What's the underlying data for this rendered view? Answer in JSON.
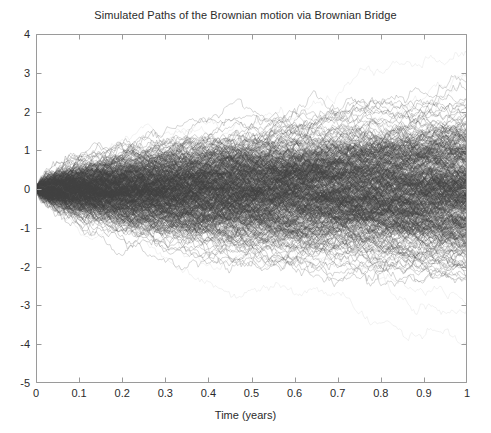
{
  "chart": {
    "title": "Simulated Paths of the Brownian motion via Brownian Bridge",
    "xlabel": "Time (years)",
    "ylabel": ""
  },
  "chart_data": {
    "type": "line",
    "title": "Simulated Paths of the Brownian motion via Brownian Bridge",
    "subtitle": "",
    "xlabel": "Time (years)",
    "ylabel": "",
    "xlim": [
      0,
      1
    ],
    "ylim": [
      -5,
      4
    ],
    "xticks": [
      0,
      0.1,
      0.2,
      0.3,
      0.4,
      0.5,
      0.6,
      0.7,
      0.8,
      0.9,
      1
    ],
    "xticklabels": [
      "0",
      "0.1",
      "0.2",
      "0.3",
      "0.4",
      "0.5",
      "0.6",
      "0.7",
      "0.8",
      "0.9",
      "1"
    ],
    "yticks": [
      -5,
      -4,
      -3,
      -2,
      -1,
      0,
      1,
      2,
      3,
      4
    ],
    "yticklabels": [
      "-5",
      "-4",
      "-3",
      "-2",
      "-1",
      "0",
      "1",
      "2",
      "3",
      "4"
    ],
    "grid": false,
    "legend": false,
    "legend_position": "none",
    "annotations": [],
    "process": "Brownian motion simulated via Brownian Bridge construction",
    "n_paths": 500,
    "n_steps": 250,
    "start_value": 0,
    "start_time": 0,
    "end_time": 1,
    "volatility": 1,
    "drift": 0,
    "line_color": "#3f3f3f",
    "line_width": 0.4,
    "line_opacity": 0.28,
    "envelope_note": "Paths all start at 0 at t=0 and fan out as sqrt(t); extreme outliers reach about +3.9 and -4.5 at t=1",
    "quantile_envelope": {
      "x": [
        0,
        0.1,
        0.2,
        0.3,
        0.4,
        0.5,
        0.6,
        0.7,
        0.8,
        0.9,
        1.0
      ],
      "p995": [
        0.0,
        0.81,
        1.15,
        1.41,
        1.63,
        1.82,
        1.99,
        2.15,
        2.3,
        2.44,
        2.58
      ],
      "p975": [
        0.0,
        0.62,
        0.88,
        1.07,
        1.24,
        1.39,
        1.52,
        1.64,
        1.75,
        1.86,
        1.96
      ],
      "p84": [
        0.0,
        0.32,
        0.45,
        0.55,
        0.63,
        0.71,
        0.77,
        0.84,
        0.89,
        0.95,
        1.0
      ],
      "p50": [
        0.0,
        0.0,
        0.0,
        0.0,
        0.0,
        0.0,
        0.0,
        0.0,
        0.0,
        0.0,
        0.0
      ],
      "p16": [
        0.0,
        -0.32,
        -0.45,
        -0.55,
        -0.63,
        -0.71,
        -0.77,
        -0.84,
        -0.89,
        -0.95,
        -1.0
      ],
      "p025": [
        0.0,
        -0.62,
        -0.88,
        -1.07,
        -1.24,
        -1.39,
        -1.52,
        -1.64,
        -1.75,
        -1.86,
        -1.96
      ],
      "p005": [
        0.0,
        -0.81,
        -1.15,
        -1.41,
        -1.63,
        -1.82,
        -1.99,
        -2.15,
        -2.3,
        -2.44,
        -2.58
      ],
      "max": [
        0.0,
        1.3,
        1.85,
        2.3,
        2.6,
        2.95,
        3.25,
        3.45,
        3.6,
        3.8,
        3.9
      ],
      "min": [
        0.0,
        -1.3,
        -1.85,
        -2.25,
        -2.6,
        -2.9,
        -3.2,
        -3.5,
        -3.85,
        -4.2,
        -4.5
      ]
    }
  },
  "style": {
    "background": "#ffffff",
    "axis_color": "#9a9a9a",
    "text_color": "#2b2b2b",
    "path_color": "#3f3f3f"
  }
}
